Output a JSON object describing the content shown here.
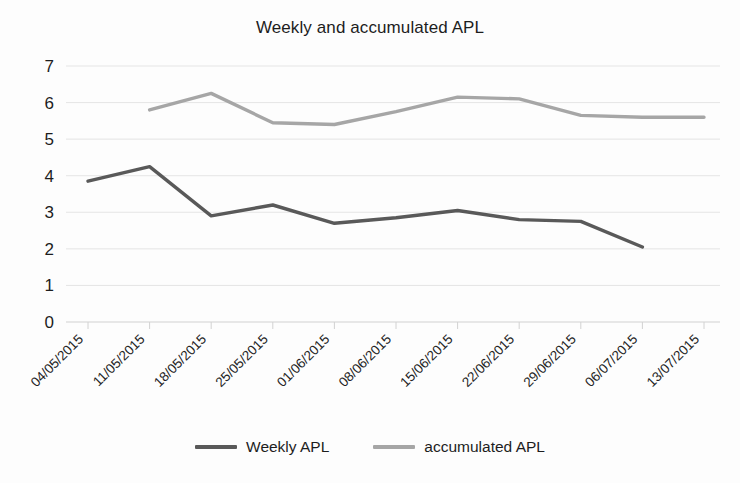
{
  "chart_data": {
    "type": "line",
    "title": "Weekly and accumulated APL",
    "xlabel": "",
    "ylabel": "",
    "ylim": [
      0,
      7
    ],
    "ytick_step": 1,
    "yticks": [
      "7",
      "6",
      "5",
      "4",
      "3",
      "2",
      "1",
      "0"
    ],
    "grid": true,
    "grid_axis": "y",
    "legend_position": "bottom",
    "categories": [
      "04/05/2015",
      "11/05/2015",
      "18/05/2015",
      "25/05/2015",
      "01/06/2015",
      "08/06/2015",
      "15/06/2015",
      "22/06/2015",
      "29/06/2015",
      "06/07/2015",
      "13/07/2015"
    ],
    "series": [
      {
        "name": "Weekly APL",
        "color": "#595959",
        "values": [
          3.85,
          4.25,
          2.9,
          3.2,
          2.7,
          2.85,
          3.05,
          2.8,
          2.75,
          2.05,
          null
        ]
      },
      {
        "name": "accumulated APL",
        "color": "#a6a6a6",
        "values": [
          null,
          5.8,
          6.25,
          5.45,
          5.4,
          5.75,
          6.15,
          6.1,
          5.65,
          5.6,
          5.6
        ]
      }
    ]
  },
  "legend": {
    "items": [
      {
        "label": "Weekly APL",
        "color": "#595959"
      },
      {
        "label": "accumulated APL",
        "color": "#a6a6a6"
      }
    ]
  },
  "axis": {
    "y_axis_color": "#d9d9d9",
    "gridline_color": "#e2e2e2",
    "baseline_color": "#d2d2d2"
  }
}
